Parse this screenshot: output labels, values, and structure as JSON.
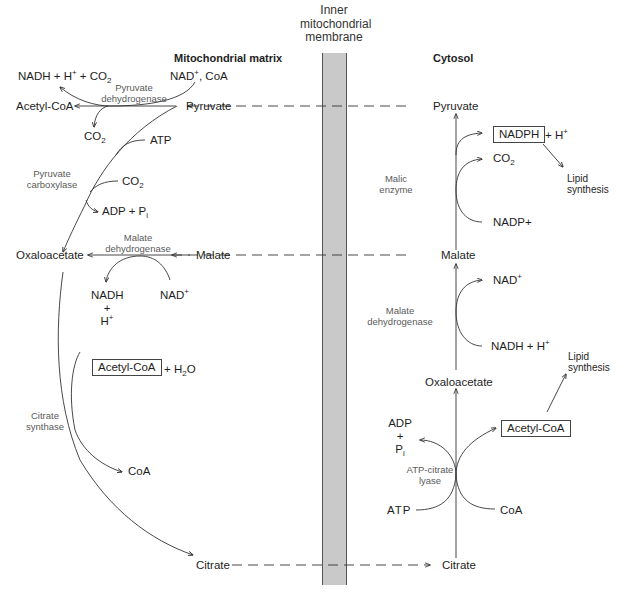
{
  "headers": {
    "matrix": "Mitochondrial matrix",
    "membrane_line1": "Inner",
    "membrane_line2": "mitochondrial",
    "membrane_line3": "membrane",
    "cytosol": "Cytosol"
  },
  "matrix": {
    "nadh_h_co2": {
      "nadh": "NADH + H",
      "plus": "+",
      "mid": " + CO",
      "sub": "2"
    },
    "nad_coa": {
      "nad": "NAD",
      "plus": "+",
      "rest": ", CoA"
    },
    "pdh_enzyme": {
      "line1": "Pyruvate",
      "line2": "dehydrogenase"
    },
    "acetyl_coa_1": "Acetyl-CoA",
    "pyruvate": "Pyruvate",
    "co2_1": {
      "co": "CO",
      "sub": "2"
    },
    "atp": "ATP",
    "pc_enzyme": {
      "line1": "Pyruvate",
      "line2": "carboxylase"
    },
    "co2_2": {
      "co": "CO",
      "sub": "2"
    },
    "adp_pi": {
      "adp": "ADP + P",
      "sub": "i"
    },
    "mdh_enzyme": {
      "line1": "Malate",
      "line2": "dehydrogenase"
    },
    "oxaloacetate": "Oxaloacetate",
    "malate": "Malate",
    "nadh_stack": {
      "l1": "NADH",
      "l2": "+",
      "l3": "H",
      "sup": "+"
    },
    "nad_plus": {
      "nad": "NAD",
      "sup": "+"
    },
    "acetyl_coa_box": "Acetyl-CoA",
    "h2o": {
      "pre": "+ H",
      "sub": "2",
      "post": "O"
    },
    "cs_enzyme": {
      "line1": "Citrate",
      "line2": "synthase"
    },
    "coa": "CoA",
    "citrate": "Citrate"
  },
  "cytosol": {
    "pyruvate": "Pyruvate",
    "nadph_box": "NADPH",
    "h_plus": {
      "pre": "+ H",
      "sup": "+"
    },
    "co2": {
      "co": "CO",
      "sub": "2"
    },
    "malic_enzyme": {
      "line1": "Malic",
      "line2": "enzyme"
    },
    "lipid_1": {
      "line1": "Lipid",
      "line2": "synthesis"
    },
    "nadp_plus": "NADP+",
    "malate": "Malate",
    "nad_plus": {
      "nad": "NAD",
      "sup": "+"
    },
    "mdh_enzyme": {
      "line1": "Malate",
      "line2": "dehydrogenase"
    },
    "nadh_h": {
      "pre": "NADH + H",
      "sup": "+"
    },
    "lipid_2": {
      "line1": "Lipid",
      "line2": "synthesis"
    },
    "oxaloacetate": "Oxaloacetate",
    "adp_stack": {
      "l1": "ADP",
      "l2": "+",
      "l3": "P",
      "sub": "i"
    },
    "acetyl_coa_box": "Acetyl-CoA",
    "acl_enzyme": {
      "line1": "ATP-citrate",
      "line2": "lyase"
    },
    "atp": "ATP",
    "coa": "CoA",
    "citrate": "Citrate"
  },
  "colors": {
    "membrane_fill": "#c9c9c9",
    "line": "#333333",
    "enzyme_text": "#5a5a5a"
  }
}
